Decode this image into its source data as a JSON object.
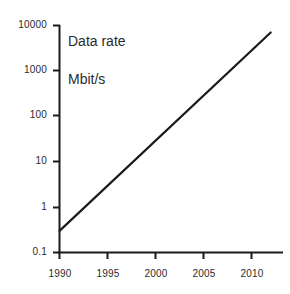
{
  "chart_data": {
    "type": "line",
    "title": "Data rate\nMbit/s",
    "title_line1": "Data rate",
    "title_line2": "Mbit/s",
    "xlabel": "",
    "ylabel": "Data rate Mbit/s",
    "yscale": "log",
    "xscale": "linear",
    "grid": false,
    "legend": false,
    "xlim": [
      1989,
      2012.5
    ],
    "ylim": [
      0.1,
      10000
    ],
    "xticks": [
      1990,
      1995,
      2000,
      2005,
      2010
    ],
    "xtick_labels": [
      "1990",
      "1995",
      "2000",
      "2005",
      "2010"
    ],
    "yticks": [
      0.1,
      1,
      10,
      100,
      1000,
      10000
    ],
    "ytick_labels": [
      "0.1",
      "1",
      "10",
      "100",
      "1000",
      "10000"
    ],
    "series": [
      {
        "name": "Data rate",
        "color": "#1a1a1a",
        "x": [
          1990,
          2012
        ],
        "values": [
          0.3,
          7000
        ]
      }
    ],
    "x": [
      1990,
      1995,
      2000,
      2005,
      2010,
      2012
    ],
    "values": [
      0.3,
      4,
      55,
      700,
      5000,
      7000
    ]
  },
  "axes": {
    "line_color": "#1a1a1a",
    "tick_color": "#1a1a1a",
    "background": "#ffffff",
    "text_color": "#2b2b2b"
  }
}
